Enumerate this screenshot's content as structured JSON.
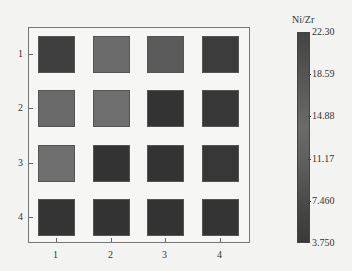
{
  "chart_data": {
    "type": "heatmap",
    "title": "",
    "xlabel": "",
    "ylabel": "",
    "x_ticks": [
      "1",
      "2",
      "3",
      "4"
    ],
    "y_ticks": [
      "1",
      "2",
      "3",
      "4"
    ],
    "colorbar": {
      "title": "Ni/Zr",
      "ticks": [
        "22.30",
        "18.59",
        "14.88",
        "11.17",
        "7.460",
        "3.750"
      ],
      "range": [
        3.75,
        22.3
      ]
    },
    "rows": [
      [
        5.5,
        13.5,
        11.5,
        5.5
      ],
      [
        13.5,
        14.0,
        4.5,
        5.0
      ],
      [
        14.5,
        4.5,
        4.5,
        5.0
      ],
      [
        4.5,
        4.5,
        4.5,
        4.5
      ]
    ],
    "colors": [
      [
        "#3f3f3f",
        "#6b6b6b",
        "#5a5a5a",
        "#3c3c3c"
      ],
      [
        "#696969",
        "#6e6e6e",
        "#333333",
        "#383838"
      ],
      [
        "#6f6f6f",
        "#333333",
        "#333333",
        "#373737"
      ],
      [
        "#343434",
        "#333333",
        "#333333",
        "#343434"
      ]
    ]
  }
}
